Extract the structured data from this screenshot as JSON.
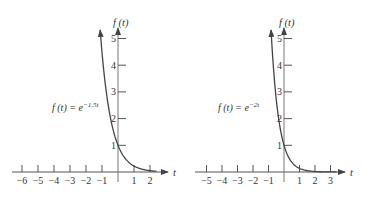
{
  "chart_data": [
    {
      "type": "line",
      "title": "",
      "function_label": "f(t) = e^{-1.5t}",
      "formula_base": "f (t) = e",
      "formula_exponent": "−1.5t",
      "k": -1.5,
      "xlabel": "t",
      "ylabel": "f (t)",
      "xlim": [
        -6,
        2
      ],
      "ylim": [
        0,
        5
      ],
      "x_ticks": [
        "−6",
        "−5",
        "−4",
        "−3",
        "−2",
        "−1",
        "1",
        "2"
      ],
      "x_tick_values": [
        -6,
        -5,
        -4,
        -3,
        -2,
        -1,
        1,
        2
      ],
      "y_ticks": [
        "1",
        "2",
        "3",
        "4",
        "5"
      ],
      "y_tick_values": [
        1,
        2,
        3,
        4,
        5
      ],
      "grid": false,
      "x": [
        -1.2,
        -1.0,
        -0.75,
        -0.5,
        -0.25,
        0,
        0.5,
        1,
        1.5,
        2,
        2.4
      ],
      "y": [
        6.05,
        4.48,
        3.08,
        2.12,
        1.45,
        1.0,
        0.47,
        0.22,
        0.11,
        0.05,
        0.03
      ]
    },
    {
      "type": "line",
      "title": "",
      "function_label": "f(t) = e^{-2t}",
      "formula_base": "f (t) = e",
      "formula_exponent": "−2t",
      "k": -2,
      "xlabel": "t",
      "ylabel": "f (t)",
      "xlim": [
        -5,
        3
      ],
      "ylim": [
        0,
        5
      ],
      "x_ticks": [
        "−5",
        "−4",
        "−3",
        "−2",
        "−1",
        "1",
        "2",
        "3"
      ],
      "x_tick_values": [
        -5,
        -4,
        -3,
        -2,
        -1,
        1,
        2,
        3
      ],
      "y_ticks": [
        "1",
        "2",
        "3",
        "4",
        "5"
      ],
      "y_tick_values": [
        1,
        2,
        3,
        4,
        5
      ],
      "grid": false,
      "x": [
        -0.9,
        -0.75,
        -0.5,
        -0.25,
        0,
        0.5,
        1,
        1.5,
        2,
        3,
        3.4
      ],
      "y": [
        6.05,
        4.48,
        2.72,
        1.65,
        1.0,
        0.37,
        0.14,
        0.05,
        0.02,
        0.0,
        0.0
      ]
    }
  ]
}
